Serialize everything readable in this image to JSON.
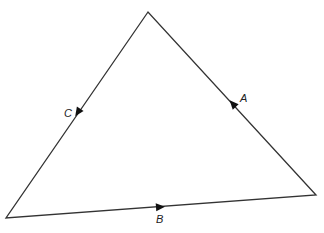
{
  "diagram": {
    "type": "triangle-vector-loop",
    "vertices": {
      "top": [
        148,
        12
      ],
      "bottom_left": [
        6,
        218
      ],
      "bottom_right": [
        316,
        195
      ]
    },
    "edges": [
      {
        "label": "A",
        "from": "bottom_right",
        "to": "top",
        "arrow_direction": "toward top"
      },
      {
        "label": "B",
        "from": "bottom_left",
        "to": "bottom_right",
        "arrow_direction": "toward bottom right"
      },
      {
        "label": "C",
        "from": "top",
        "to": "bottom_left",
        "arrow_direction": "toward bottom left"
      }
    ],
    "labels": {
      "a": "A",
      "b": "B",
      "c": "C"
    },
    "line_color": "#333333"
  }
}
